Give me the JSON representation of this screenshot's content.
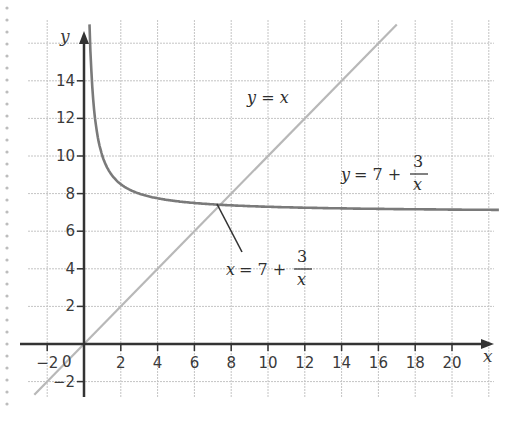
{
  "chart_data": {
    "type": "line",
    "title": "",
    "xlabel": "x",
    "ylabel": "y",
    "xlim": [
      -3,
      22
    ],
    "ylim": [
      -3,
      17
    ],
    "grid": true,
    "grid_spacing": 2,
    "x_ticks": [
      -2,
      0,
      2,
      4,
      6,
      8,
      10,
      12,
      14,
      16,
      18,
      20
    ],
    "x_tick_labels": [
      "-2",
      "0",
      "2",
      "4",
      "6",
      "8",
      "10",
      "12",
      "14",
      "16",
      "18",
      "20"
    ],
    "y_ticks": [
      -2,
      2,
      4,
      6,
      8,
      10,
      12,
      14
    ],
    "y_tick_labels": [
      "-2",
      "2",
      "4",
      "6",
      "8",
      "10",
      "12",
      "14"
    ],
    "series": [
      {
        "name": "y = x",
        "color": "#b8b8b8",
        "x": [
          -2.7,
          17
        ],
        "y": [
          -2.7,
          17
        ]
      },
      {
        "name": "y = 7 + 3/x",
        "color": "#7a7a7a",
        "x": [
          0.3,
          0.5,
          1,
          1.5,
          2,
          3,
          4,
          5,
          6,
          7.4,
          10,
          15,
          20,
          22.5
        ],
        "y": [
          17,
          13,
          10,
          9,
          8.5,
          8,
          7.75,
          7.6,
          7.5,
          7.41,
          7.3,
          7.2,
          7.15,
          7.13
        ]
      }
    ],
    "annotations": [
      {
        "text": "y = x",
        "x": 11,
        "y": 11.5
      },
      {
        "text": "y = 7 + 3/x",
        "x": 16,
        "y": 9.2
      },
      {
        "text": "x = 7 + 3/x",
        "x": 10,
        "y": 4,
        "points_to": [
          7.4,
          7.4
        ]
      }
    ]
  },
  "labels": {
    "x_axis": "x",
    "y_axis": "y",
    "origin": "0",
    "line_label": "y = x",
    "curve_label": {
      "lhs": "y",
      "eq": "= 7 +",
      "num": "3",
      "den": "x"
    },
    "intersection_label": {
      "lhs": "x",
      "eq": "= 7 +",
      "num": "3",
      "den": "x"
    }
  }
}
